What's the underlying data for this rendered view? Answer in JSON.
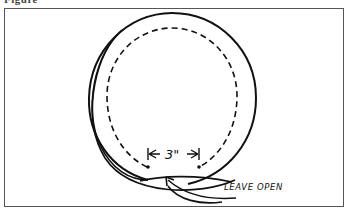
{
  "figure": {
    "label": "Figure"
  },
  "diagram": {
    "dimension_label": "3\"",
    "annotation": "LEAVE OPEN",
    "colors": {
      "ink": "#111111",
      "frame": "#555555",
      "background": "#ffffff"
    },
    "elements": [
      {
        "type": "solid-circle",
        "description": "outer stitching/cut line"
      },
      {
        "type": "dashed-circle",
        "description": "inner seam line"
      },
      {
        "type": "dimension",
        "between": "two dots at base of dashed circle",
        "value": "3\""
      },
      {
        "type": "arrow",
        "points_to": "gap at bottom",
        "label": "LEAVE OPEN"
      }
    ]
  }
}
